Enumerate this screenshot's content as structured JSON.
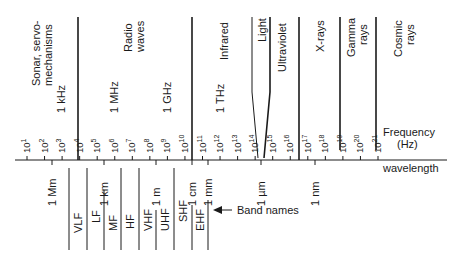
{
  "regions": [
    {
      "id": "sonar",
      "lines": [
        "Sonar, servo-",
        "mechanisms"
      ]
    },
    {
      "id": "radio",
      "lines": [
        "Radio",
        "waves"
      ]
    },
    {
      "id": "infrared",
      "lines": [
        "Infrared"
      ]
    },
    {
      "id": "light",
      "lines": [
        "Light"
      ]
    },
    {
      "id": "ultraviolet",
      "lines": [
        "Ultraviolet"
      ]
    },
    {
      "id": "xrays",
      "lines": [
        "X-rays"
      ]
    },
    {
      "id": "gamma",
      "lines": [
        "Gamma",
        "rays"
      ]
    },
    {
      "id": "cosmic",
      "lines": [
        "Cosmic",
        "rays"
      ]
    }
  ],
  "frequency_markers": [
    "1 kHz",
    "1 MHz",
    "1 GHz",
    "1 THz"
  ],
  "frequency_ticks": {
    "base": "10",
    "exponents": [
      "1",
      "2",
      "3",
      "4",
      "5",
      "6",
      "7",
      "8",
      "9",
      "10",
      "11",
      "12",
      "13",
      "14",
      "15",
      "16",
      "17",
      "18",
      "19",
      "20",
      "21"
    ]
  },
  "axis_labels": {
    "frequency": [
      "Frequency",
      "(Hz)"
    ],
    "wavelength": "wavelength"
  },
  "wavelength_markers": [
    "1 Mm",
    "1 km",
    "1 m",
    "1 cm",
    "1 mm",
    "1 µm",
    "1 nm"
  ],
  "band_names": [
    "VLF",
    "LF",
    "MF",
    "HF",
    "VHF",
    "UHF",
    "SHF",
    "EHF"
  ],
  "band_names_caption": "Band names"
}
